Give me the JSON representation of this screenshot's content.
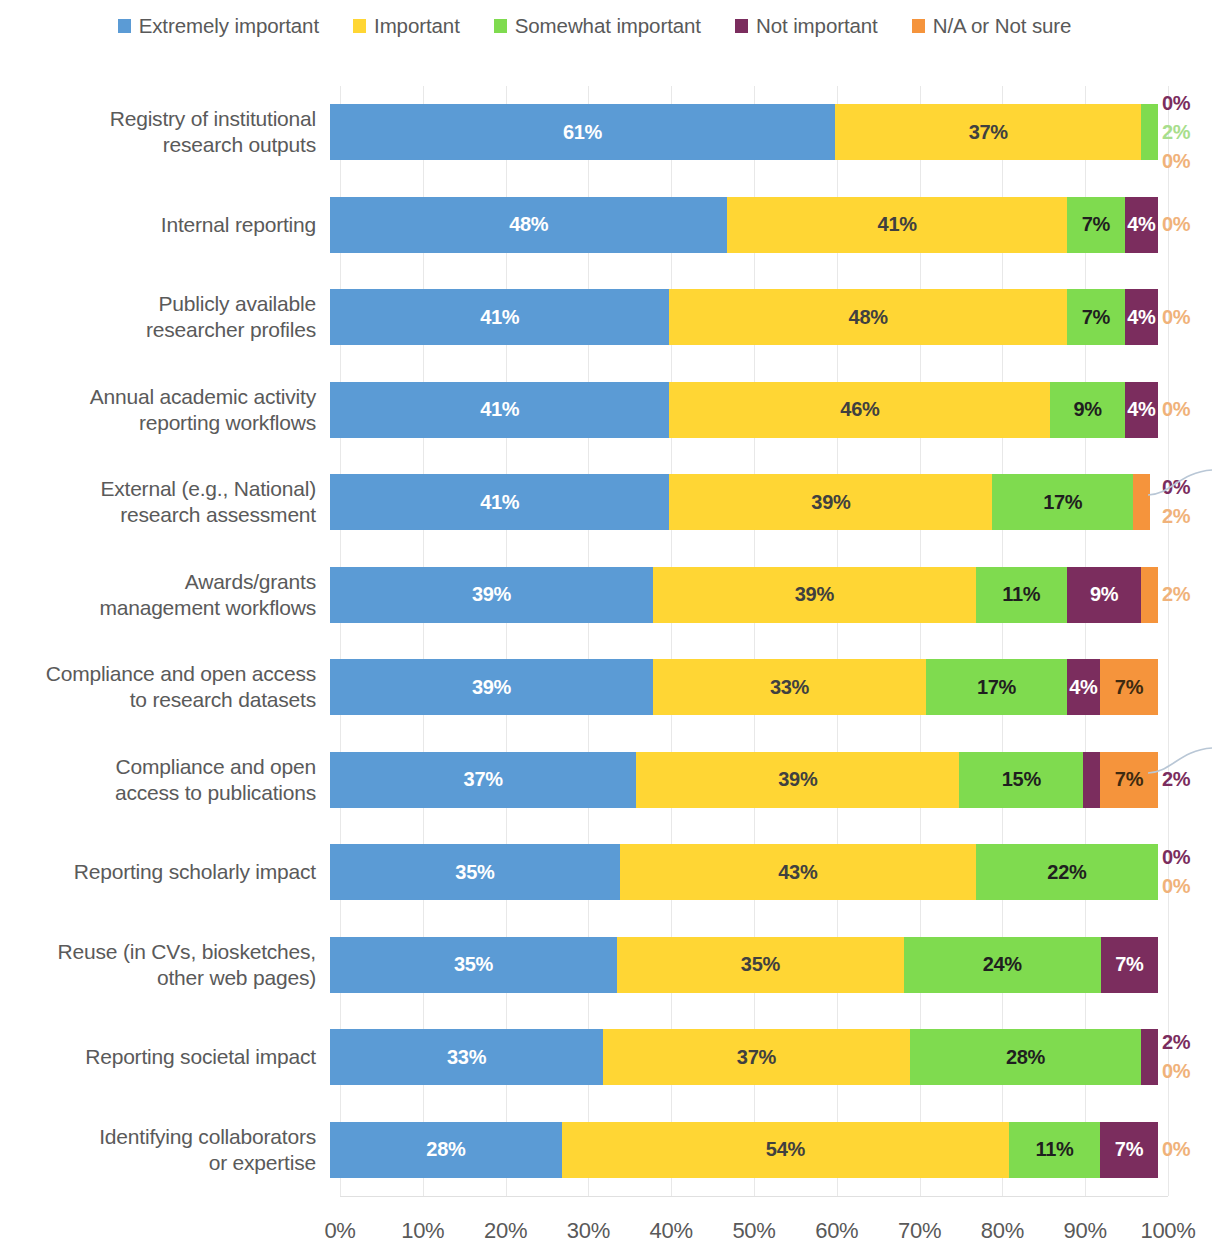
{
  "legend": {
    "items": [
      {
        "label": "Extremely important",
        "color": "#5B9BD5"
      },
      {
        "label": "Important",
        "color": "#FFD634"
      },
      {
        "label": "Somewhat important",
        "color": "#7FDB4F"
      },
      {
        "label": "Not important",
        "color": "#7B2D5E"
      },
      {
        "label": "N/A or Not sure",
        "color": "#F5943C"
      }
    ]
  },
  "chart_data": {
    "type": "bar",
    "orientation": "horizontal",
    "stacked": true,
    "normalized": true,
    "title": "",
    "xlabel": "",
    "ylabel": "",
    "xlim": [
      0,
      100
    ],
    "grid": true,
    "legend_position": "top",
    "xticks": [
      "0%",
      "10%",
      "20%",
      "30%",
      "40%",
      "50%",
      "60%",
      "70%",
      "80%",
      "90%",
      "100%"
    ],
    "xtick_values": [
      0,
      10,
      20,
      30,
      40,
      50,
      60,
      70,
      80,
      90,
      100
    ],
    "series": [
      {
        "name": "Extremely important",
        "color": "#5B9BD5"
      },
      {
        "name": "Important",
        "color": "#FFD634"
      },
      {
        "name": "Somewhat important",
        "color": "#7FDB4F"
      },
      {
        "name": "Not important",
        "color": "#7B2D5E"
      },
      {
        "name": "N/A or Not sure",
        "color": "#F5943C"
      }
    ],
    "categories": [
      "Registry of institutional research outputs",
      "Internal reporting",
      "Publicly available researcher profiles",
      "Annual academic activity reporting workflows",
      "External (e.g., National) research assessment",
      "Awards/grants management workflows",
      "Compliance and open access to research datasets",
      "Compliance and open access to publications",
      "Reporting scholarly impact",
      "Reuse (in CVs, biosketches, other web pages)",
      "Reporting societal impact",
      "Identifying collaborators or expertise"
    ],
    "values": [
      [
        61,
        37,
        2,
        0,
        0
      ],
      [
        48,
        41,
        7,
        4,
        0
      ],
      [
        41,
        48,
        7,
        4,
        0
      ],
      [
        41,
        46,
        9,
        4,
        0
      ],
      [
        41,
        39,
        17,
        0,
        2
      ],
      [
        39,
        39,
        11,
        9,
        2
      ],
      [
        39,
        33,
        17,
        4,
        7
      ],
      [
        37,
        39,
        15,
        2,
        7
      ],
      [
        35,
        43,
        22,
        0,
        0
      ],
      [
        35,
        35,
        24,
        7,
        0
      ],
      [
        33,
        37,
        28,
        2,
        0
      ],
      [
        28,
        54,
        11,
        7,
        0
      ]
    ]
  },
  "rows": [
    {
      "label_lines": [
        "Registry of institutional",
        "research outputs"
      ],
      "segments": [
        {
          "series": 0,
          "value": 61,
          "text": "61%",
          "inside": true
        },
        {
          "series": 1,
          "value": 37,
          "text": "37%",
          "inside": true
        },
        {
          "series": 2,
          "value": 2,
          "text": "2%",
          "inside": false
        },
        {
          "series": 3,
          "value": 0,
          "text": "0%",
          "inside": false
        },
        {
          "series": 4,
          "value": 0,
          "text": "0%",
          "inside": false
        }
      ],
      "outside_order": [
        "0%",
        "2%",
        "0%"
      ],
      "outside_colors": [
        "#7B2D5E",
        "#A8DE8C",
        "#F0B27A"
      ],
      "leader": false
    },
    {
      "label_lines": [
        "Internal reporting"
      ],
      "segments": [
        {
          "series": 0,
          "value": 48,
          "text": "48%",
          "inside": true
        },
        {
          "series": 1,
          "value": 41,
          "text": "41%",
          "inside": true
        },
        {
          "series": 2,
          "value": 7,
          "text": "7%",
          "inside": true
        },
        {
          "series": 3,
          "value": 4,
          "text": "4%",
          "inside": true
        },
        {
          "series": 4,
          "value": 0,
          "text": "0%",
          "inside": false
        }
      ],
      "outside_order": [
        "0%"
      ],
      "outside_colors": [
        "#F0B27A"
      ],
      "leader": false
    },
    {
      "label_lines": [
        "Publicly available",
        "researcher profiles"
      ],
      "segments": [
        {
          "series": 0,
          "value": 41,
          "text": "41%",
          "inside": true
        },
        {
          "series": 1,
          "value": 48,
          "text": "48%",
          "inside": true
        },
        {
          "series": 2,
          "value": 7,
          "text": "7%",
          "inside": true
        },
        {
          "series": 3,
          "value": 4,
          "text": "4%",
          "inside": true
        },
        {
          "series": 4,
          "value": 0,
          "text": "0%",
          "inside": false
        }
      ],
      "outside_order": [
        "0%"
      ],
      "outside_colors": [
        "#F0B27A"
      ],
      "leader": false
    },
    {
      "label_lines": [
        "Annual academic activity",
        "reporting workflows"
      ],
      "segments": [
        {
          "series": 0,
          "value": 41,
          "text": "41%",
          "inside": true
        },
        {
          "series": 1,
          "value": 46,
          "text": "46%",
          "inside": true
        },
        {
          "series": 2,
          "value": 9,
          "text": "9%",
          "inside": true
        },
        {
          "series": 3,
          "value": 4,
          "text": "4%",
          "inside": true
        },
        {
          "series": 4,
          "value": 0,
          "text": "0%",
          "inside": false
        }
      ],
      "outside_order": [
        "0%"
      ],
      "outside_colors": [
        "#F0B27A"
      ],
      "leader": false
    },
    {
      "label_lines": [
        "External (e.g., National)",
        "research assessment"
      ],
      "segments": [
        {
          "series": 0,
          "value": 41,
          "text": "41%",
          "inside": true
        },
        {
          "series": 1,
          "value": 39,
          "text": "39%",
          "inside": true
        },
        {
          "series": 2,
          "value": 17,
          "text": "17%",
          "inside": true
        },
        {
          "series": 3,
          "value": 0,
          "text": "0%",
          "inside": false
        },
        {
          "series": 4,
          "value": 2,
          "text": "2%",
          "inside": false
        }
      ],
      "outside_order": [
        "0%",
        "2%"
      ],
      "outside_colors": [
        "#7B2D5E",
        "#F0B27A"
      ],
      "leader": true
    },
    {
      "label_lines": [
        "Awards/grants",
        "management workflows"
      ],
      "segments": [
        {
          "series": 0,
          "value": 39,
          "text": "39%",
          "inside": true
        },
        {
          "series": 1,
          "value": 39,
          "text": "39%",
          "inside": true
        },
        {
          "series": 2,
          "value": 11,
          "text": "11%",
          "inside": true
        },
        {
          "series": 3,
          "value": 9,
          "text": "9%",
          "inside": true
        },
        {
          "series": 4,
          "value": 2,
          "text": "2%",
          "inside": false
        }
      ],
      "outside_order": [
        "2%"
      ],
      "outside_colors": [
        "#F0B27A"
      ],
      "leader": false
    },
    {
      "label_lines": [
        "Compliance and open access",
        "to research datasets"
      ],
      "segments": [
        {
          "series": 0,
          "value": 39,
          "text": "39%",
          "inside": true
        },
        {
          "series": 1,
          "value": 33,
          "text": "33%",
          "inside": true
        },
        {
          "series": 2,
          "value": 17,
          "text": "17%",
          "inside": true
        },
        {
          "series": 3,
          "value": 4,
          "text": "4%",
          "inside": true
        },
        {
          "series": 4,
          "value": 7,
          "text": "7%",
          "inside": true
        }
      ],
      "outside_order": [],
      "outside_colors": [],
      "leader": false
    },
    {
      "label_lines": [
        "Compliance and open",
        "access to publications"
      ],
      "segments": [
        {
          "series": 0,
          "value": 37,
          "text": "37%",
          "inside": true
        },
        {
          "series": 1,
          "value": 39,
          "text": "39%",
          "inside": true
        },
        {
          "series": 2,
          "value": 15,
          "text": "15%",
          "inside": true
        },
        {
          "series": 3,
          "value": 2,
          "text": "2%",
          "inside": false
        },
        {
          "series": 4,
          "value": 7,
          "text": "7%",
          "inside": true
        }
      ],
      "outside_order": [
        "2%"
      ],
      "outside_colors": [
        "#7B2D5E"
      ],
      "leader": true
    },
    {
      "label_lines": [
        "Reporting scholarly impact"
      ],
      "segments": [
        {
          "series": 0,
          "value": 35,
          "text": "35%",
          "inside": true
        },
        {
          "series": 1,
          "value": 43,
          "text": "43%",
          "inside": true
        },
        {
          "series": 2,
          "value": 22,
          "text": "22%",
          "inside": true
        },
        {
          "series": 3,
          "value": 0,
          "text": "0%",
          "inside": false
        },
        {
          "series": 4,
          "value": 0,
          "text": "0%",
          "inside": false
        }
      ],
      "outside_order": [
        "0%",
        "0%"
      ],
      "outside_colors": [
        "#7B2D5E",
        "#F0B27A"
      ],
      "leader": false
    },
    {
      "label_lines": [
        "Reuse (in CVs, biosketches,",
        "other web pages)"
      ],
      "segments": [
        {
          "series": 0,
          "value": 35,
          "text": "35%",
          "inside": true
        },
        {
          "series": 1,
          "value": 35,
          "text": "35%",
          "inside": true
        },
        {
          "series": 2,
          "value": 24,
          "text": "24%",
          "inside": true
        },
        {
          "series": 3,
          "value": 7,
          "text": "7%",
          "inside": true
        },
        {
          "series": 4,
          "value": 0,
          "text": "",
          "inside": false
        }
      ],
      "outside_order": [],
      "outside_colors": [],
      "leader": false
    },
    {
      "label_lines": [
        "Reporting societal impact"
      ],
      "segments": [
        {
          "series": 0,
          "value": 33,
          "text": "33%",
          "inside": true
        },
        {
          "series": 1,
          "value": 37,
          "text": "37%",
          "inside": true
        },
        {
          "series": 2,
          "value": 28,
          "text": "28%",
          "inside": true
        },
        {
          "series": 3,
          "value": 2,
          "text": "2%",
          "inside": false
        },
        {
          "series": 4,
          "value": 0,
          "text": "0%",
          "inside": false
        }
      ],
      "outside_order": [
        "2%",
        "0%"
      ],
      "outside_colors": [
        "#7B2D5E",
        "#F0B27A"
      ],
      "leader": false
    },
    {
      "label_lines": [
        "Identifying collaborators",
        "or expertise"
      ],
      "segments": [
        {
          "series": 0,
          "value": 28,
          "text": "28%",
          "inside": true
        },
        {
          "series": 1,
          "value": 54,
          "text": "54%",
          "inside": true
        },
        {
          "series": 2,
          "value": 11,
          "text": "11%",
          "inside": true
        },
        {
          "series": 3,
          "value": 7,
          "text": "7%",
          "inside": true
        },
        {
          "series": 4,
          "value": 0,
          "text": "0%",
          "inside": false
        }
      ],
      "outside_order": [
        "0%"
      ],
      "outside_colors": [
        "#F0B27A"
      ],
      "leader": false
    }
  ]
}
